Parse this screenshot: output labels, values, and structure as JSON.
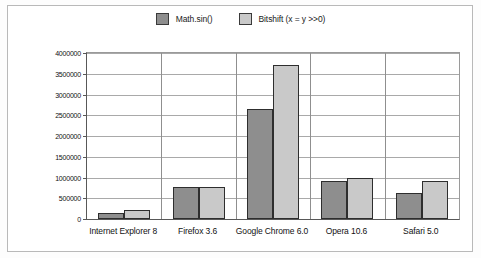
{
  "chart_data": {
    "type": "bar",
    "title": "",
    "subtitle": "",
    "xlabel": "",
    "ylabel": "Iterations Per Second",
    "categories": [
      "Internet Explorer 8",
      "Firefox 3.6",
      "Google Chrome 6.0",
      "Opera 10.6",
      "Safari 5.0"
    ],
    "series": [
      {
        "name": "Math.sin()",
        "color": "#8e8e8e",
        "values": [
          145000,
          770000,
          2660000,
          920000,
          615000
        ]
      },
      {
        "name": "Bitshift (x = y >>0)",
        "color": "#c9c9c9",
        "values": [
          225000,
          775000,
          3700000,
          995000,
          915000
        ]
      }
    ],
    "ylim": [
      0,
      4000000
    ],
    "ytick_values": [
      0,
      500000,
      1000000,
      1500000,
      2000000,
      2500000,
      3000000,
      3500000,
      4000000
    ],
    "ytick_labels": [
      "0",
      "500000",
      "1000000",
      "1500000",
      "2000000",
      "2500000",
      "3000000",
      "3500000",
      "4000000"
    ],
    "grid": true,
    "legend_position": "top-center",
    "orientation": "vertical",
    "grouping": "grouped"
  },
  "legend": {
    "items": [
      {
        "label": "Math.sin()",
        "color": "#8e8e8e"
      },
      {
        "label": "Bitshift (x = y >>0)",
        "color": "#c9c9c9"
      }
    ]
  }
}
